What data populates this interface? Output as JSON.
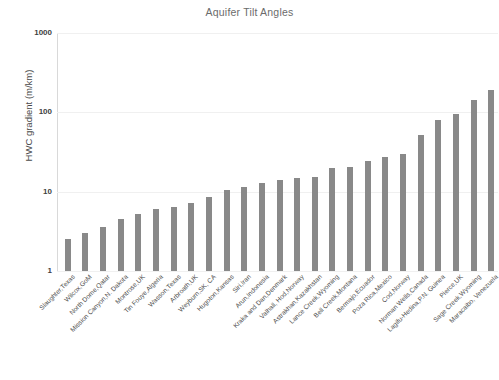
{
  "chart_data": {
    "type": "bar",
    "title": "Aquifer Tilt Angles",
    "xlabel": "",
    "ylabel": "HWC gradient (m/km)",
    "yscale": "log",
    "ylim": [
      1,
      1000
    ],
    "ytick_labels": [
      "1000",
      "100",
      "10",
      "1"
    ],
    "ytick_values": [
      1000,
      100,
      10,
      1
    ],
    "grid": true,
    "legend": null,
    "bar_color": "#898989",
    "categories": [
      "Slaughter,Texas",
      "Wilcox,GoM",
      "North Dome,Qatar",
      "Mission Canyon,N. Dakota",
      "Montrose,UK",
      "Tin Fouye,Algeria",
      "Wasson,Texas",
      "Arbroath,UK",
      "Weyburn,SK, CA",
      "Hugoton,Kansas",
      "Siri,Iran",
      "Arun,Indonesia",
      "Kraka and Dan,Denmark",
      "Valhall, Hod,Norway",
      "Astrakhan,Kazakhstan",
      "Lance Creek,Wyoming",
      "Bell Creek,Montana",
      "Bermajo,Ecuador",
      "Poza Rica,Mexico",
      "Cod,Norway",
      "Norman Wells,Canada",
      "Lagifu-Hedina,P.N. Guinea",
      "Pierce,UK",
      "Sage Creek,Wyoming",
      "Maracaibo, Venezuela"
    ],
    "values": [
      2.5,
      3.0,
      3.6,
      4.5,
      5.2,
      6.0,
      6.4,
      7.3,
      8.5,
      10.5,
      11.5,
      13.0,
      14.0,
      15.0,
      15.5,
      20.0,
      20.5,
      24.5,
      27.0,
      30.0,
      52.0,
      80.0,
      95.0,
      145.0,
      190.0
    ]
  },
  "axis": {
    "y_title": "HWC gradient (m/km)"
  }
}
